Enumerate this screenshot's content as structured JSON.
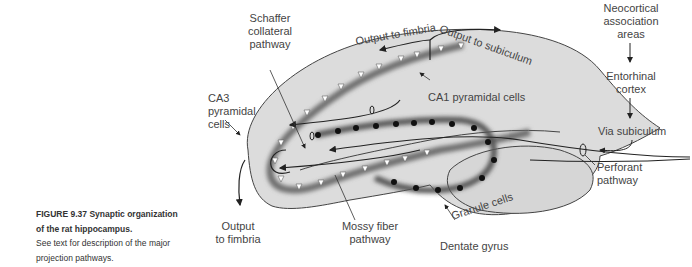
{
  "figure": {
    "caption_title": "FIGURE 9.37 Synaptic organization of the rat hippocampus.",
    "caption_line1": "FIGURE 9.37  Synaptic organization",
    "caption_line2": "of the rat hippocampus.",
    "caption_body_line1": "See text for description of the major",
    "caption_body_line2": "projection pathways."
  },
  "labels": {
    "neocortical": [
      "Neocortical",
      "association",
      "areas"
    ],
    "entorhinal": [
      "Entorhinal",
      "cortex"
    ],
    "via_subiculum": "Via subiculum",
    "perforant": [
      "Perforant",
      "pathway"
    ],
    "schaffer": [
      "Schaffer",
      "collateral",
      "pathway"
    ],
    "ca3": [
      "CA3",
      "pyramidal",
      "cells"
    ],
    "ca1": "CA1 pyramidal cells",
    "output_fimbria_top": "Output to fimbria",
    "output_subiculum": "Output to subiculum",
    "output_fimbria_bottom": [
      "Output",
      "to fimbria"
    ],
    "mossy": [
      "Mossy fiber",
      "pathway"
    ],
    "granule": "Granule cells",
    "dentate": "Dentate gyrus"
  },
  "colors": {
    "tissue_fill": "#dcdcdc",
    "outline": "#444444",
    "cell_band": "#6e6e6e",
    "granule_cell": "#111111"
  }
}
